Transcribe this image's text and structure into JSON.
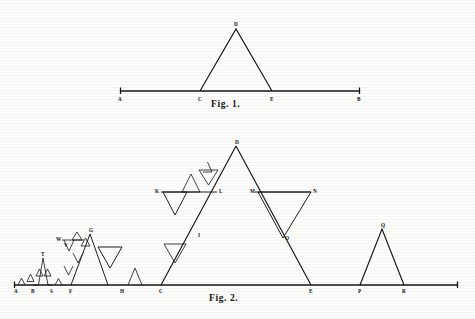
{
  "page": {
    "width": 475,
    "height": 319,
    "background": "#fdfdfb",
    "ink": "#141414"
  },
  "captions": {
    "fig1": "Fig. 1.",
    "fig2": "Fig. 2."
  },
  "chart_data": {
    "type": "diagram",
    "figures": [
      {
        "id": "fig1",
        "caption": "Fig. 1.",
        "description": "Straight line AB with equilateral triangle CDE erected on middle third",
        "baseline": {
          "from": "A",
          "to": "B",
          "y": 91,
          "x_start": 120,
          "x_end": 360
        },
        "points": [
          {
            "label": "A",
            "x": 120,
            "y": 91,
            "label_dx": -2,
            "label_dy": 10
          },
          {
            "label": "C",
            "x": 200,
            "y": 91,
            "label_dx": -2,
            "label_dy": 10
          },
          {
            "label": "E",
            "x": 272,
            "y": 91,
            "label_dx": -2,
            "label_dy": 10
          },
          {
            "label": "B",
            "x": 360,
            "y": 91,
            "label_dx": -3,
            "label_dy": 10
          },
          {
            "label": "D",
            "x": 236,
            "y": 29,
            "label_dx": -2,
            "label_dy": -3
          }
        ],
        "polyline": [
          [
            120,
            91
          ],
          [
            200,
            91
          ],
          [
            236,
            29
          ],
          [
            272,
            91
          ],
          [
            360,
            91
          ]
        ],
        "ticks": [
          [
            120,
            91
          ],
          [
            360,
            91
          ]
        ]
      },
      {
        "id": "fig2",
        "caption": "Fig. 2.",
        "description": "Successive Koch generations of increasing scale along baseline A..B",
        "baseline": {
          "y": 285,
          "x_start": 14,
          "x_end": 458
        },
        "points": [
          {
            "label": "A",
            "x": 16,
            "y": 285,
            "label_dx": -2,
            "label_dy": 8
          },
          {
            "label": "B",
            "x": 33,
            "y": 285,
            "label_dx": -2,
            "label_dy": 8
          },
          {
            "label": "S",
            "x": 52,
            "y": 285,
            "label_dx": -2,
            "label_dy": 8
          },
          {
            "label": "F",
            "x": 71,
            "y": 285,
            "label_dx": -2,
            "label_dy": 8
          },
          {
            "label": "H",
            "x": 122,
            "y": 285,
            "label_dx": -2,
            "label_dy": 8
          },
          {
            "label": "C",
            "x": 161,
            "y": 285,
            "label_dx": -2,
            "label_dy": 8
          },
          {
            "label": "E",
            "x": 311,
            "y": 285,
            "label_dx": -2,
            "label_dy": 8
          },
          {
            "label": "P",
            "x": 360,
            "y": 285,
            "label_dx": -2,
            "label_dy": 8
          },
          {
            "label": "R",
            "x": 404,
            "y": 285,
            "label_dx": -2,
            "label_dy": 8
          },
          {
            "label": "T",
            "x": 43,
            "y": 258,
            "label_dx": -2,
            "label_dy": -2
          },
          {
            "label": "V",
            "x": 63,
            "y": 242,
            "label_dx": 1,
            "label_dy": 5
          },
          {
            "label": "W",
            "x": 62,
            "y": 240,
            "label_dx": -6,
            "label_dy": 1
          },
          {
            "label": "G",
            "x": 90,
            "y": 234,
            "label_dx": -1,
            "label_dy": -2
          },
          {
            "label": "I",
            "x": 196,
            "y": 235,
            "label_dx": 2,
            "label_dy": 2
          },
          {
            "label": "K",
            "x": 161,
            "y": 192,
            "label_dx": -6,
            "label_dy": 1
          },
          {
            "label": "L",
            "x": 217,
            "y": 192,
            "label_dx": 2,
            "label_dy": 1
          },
          {
            "label": "D",
            "x": 236,
            "y": 146,
            "label_dx": -1,
            "label_dy": -2
          },
          {
            "label": "M",
            "x": 255,
            "y": 192,
            "label_dx": -5,
            "label_dy": 1
          },
          {
            "label": "N",
            "x": 311,
            "y": 192,
            "label_dx": 2,
            "label_dy": 1
          },
          {
            "label": "O",
            "x": 283,
            "y": 238,
            "label_dx": 2,
            "label_dy": 2
          },
          {
            "label": "Q",
            "x": 382,
            "y": 229,
            "label_dx": -1,
            "label_dy": -2
          }
        ],
        "stages": [
          {
            "name": "stage-1-micro",
            "span": [
              16,
              33
            ],
            "apex_y": 272
          },
          {
            "name": "stage-2-small",
            "span": [
              33,
              52
            ],
            "apex_y": 258
          },
          {
            "name": "stage-3-medium",
            "span": [
              52,
              90
            ],
            "apex_y": 234
          },
          {
            "name": "stage-4-plain",
            "span": [
              122,
              141
            ],
            "apex_y": 268
          },
          {
            "name": "stage-5-large",
            "span": [
              161,
              311
            ],
            "apex_y": 146
          },
          {
            "name": "stage-6-final",
            "span": [
              360,
              404
            ],
            "apex_y": 229
          }
        ]
      }
    ]
  }
}
